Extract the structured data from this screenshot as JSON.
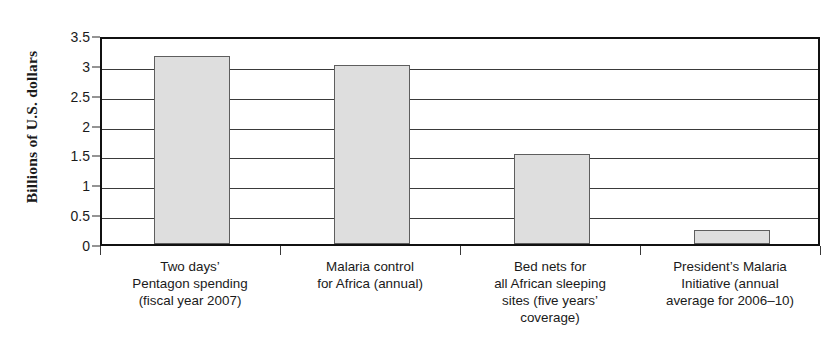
{
  "chart_data": {
    "type": "bar",
    "title": "",
    "xlabel": "",
    "ylabel": "Billions of U.S. dollars",
    "ylim": [
      0,
      3.5
    ],
    "ytick_labels": [
      "0",
      "0.5",
      "1",
      "1.5",
      "2",
      "2.5",
      "3",
      "3.5"
    ],
    "ytick_values": [
      0,
      0.5,
      1,
      1.5,
      2,
      2.5,
      3,
      3.5
    ],
    "grid": "horizontal",
    "legend": "none",
    "categories": [
      "Two days’ Pentagon spending (fiscal year 2007)",
      "Malaria control for Africa (annual)",
      "Bed nets for all African sleeping sites (five years’ coverage)",
      "President’s Malaria Initiative (annual average for 2006–10)"
    ],
    "category_lines": [
      [
        "Two days’",
        "Pentagon spending",
        "(fiscal year 2007)"
      ],
      [
        "Malaria control",
        "for Africa (annual)"
      ],
      [
        "Bed nets for",
        "all African sleeping",
        "sites (five years’",
        "coverage)"
      ],
      [
        "President’s Malaria",
        "Initiative (annual",
        "average for 2006–10)"
      ]
    ],
    "values": [
      3.15,
      3.0,
      1.5,
      0.23
    ],
    "bar_fill": "#dedede",
    "bar_edge": "#5e5e5e",
    "axis_color": "#111111",
    "grid_color": "#3a3a3a"
  }
}
